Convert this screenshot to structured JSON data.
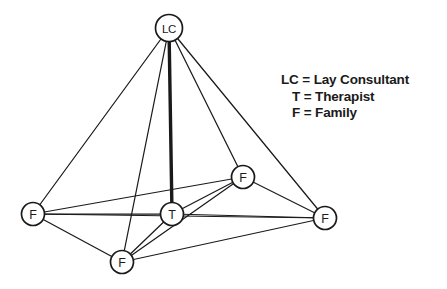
{
  "diagram": {
    "background_color": "#ffffff",
    "line_color": "#1a1a1a",
    "node_fill": "#ffffff",
    "nodes": [
      {
        "id": "LC",
        "label": "LC",
        "x": 169,
        "y": 28,
        "r": 13.5,
        "wide": true
      },
      {
        "id": "F_upper_right",
        "label": "F",
        "x": 243,
        "y": 177,
        "r": 11.5,
        "wide": false
      },
      {
        "id": "F_left",
        "label": "F",
        "x": 33,
        "y": 214,
        "r": 11.5,
        "wide": false
      },
      {
        "id": "T",
        "label": "T",
        "x": 172,
        "y": 214,
        "r": 11.5,
        "wide": false
      },
      {
        "id": "F_right",
        "label": "F",
        "x": 325,
        "y": 218,
        "r": 11.5,
        "wide": false
      },
      {
        "id": "F_bottom",
        "label": "F",
        "x": 122,
        "y": 262,
        "r": 11.5,
        "wide": false
      }
    ],
    "edges": [
      {
        "from": "LC",
        "to": "F_left",
        "bold": false
      },
      {
        "from": "LC",
        "to": "F_bottom",
        "bold": false
      },
      {
        "from": "LC",
        "to": "T",
        "bold": true
      },
      {
        "from": "LC",
        "to": "F_upper_right",
        "bold": false
      },
      {
        "from": "LC",
        "to": "F_right",
        "bold": false
      },
      {
        "from": "F_left",
        "to": "T",
        "bold": false
      },
      {
        "from": "F_left",
        "to": "F_upper_right",
        "bold": false
      },
      {
        "from": "F_left",
        "to": "F_right",
        "bold": false
      },
      {
        "from": "F_left",
        "to": "F_bottom",
        "bold": false
      },
      {
        "from": "T",
        "to": "F_upper_right",
        "bold": false
      },
      {
        "from": "T",
        "to": "F_right",
        "bold": false
      },
      {
        "from": "T",
        "to": "F_bottom",
        "bold": false
      },
      {
        "from": "F_upper_right",
        "to": "F_right",
        "bold": false
      },
      {
        "from": "F_upper_right",
        "to": "F_bottom",
        "bold": false
      },
      {
        "from": "F_bottom",
        "to": "F_right",
        "bold": false
      }
    ]
  },
  "legend": {
    "lines": [
      "LC = Lay Consultant",
      "T = Therapist",
      "F = Family"
    ],
    "line_1": "LC = Lay Consultant",
    "line_2": "T = Therapist",
    "line_3": "F = Family"
  }
}
